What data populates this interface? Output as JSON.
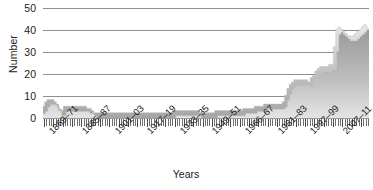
{
  "chart_data": {
    "type": "area",
    "title": "",
    "xlabel": "Years",
    "ylabel": "Number",
    "ylim": [
      0,
      50
    ],
    "yticks": [
      0,
      10,
      20,
      30,
      40,
      50
    ],
    "grid": true,
    "legend": "none",
    "x_tick_labels": [
      "1869–71",
      "1885–87",
      "1901–03",
      "1917–19",
      "1933–35",
      "1949–51",
      "1966–67",
      "1981–83",
      "1997–99",
      "2007–11"
    ],
    "categories": [
      "1866-67",
      "1867-68",
      "1868-69",
      "1869-71",
      "1870-72",
      "1871-73",
      "1872-74",
      "1873-75",
      "1875-77",
      "1876-78",
      "1877-79",
      "1878-80",
      "1879-81",
      "1880-82",
      "1881-83",
      "1882-84",
      "1884-86",
      "1885-87",
      "1886-88",
      "1887-89",
      "1888-90",
      "1889-91",
      "1890-92",
      "1891-93",
      "1893-95",
      "1894-96",
      "1895-97",
      "1896-98",
      "1897-99",
      "1898-00",
      "1899-01",
      "1900-02",
      "1901-03",
      "1902-04",
      "1903-05",
      "1904-06",
      "1905-07",
      "1906-08",
      "1907-09",
      "1908-10",
      "1909-11",
      "1910-12",
      "1911-13",
      "1912-14",
      "1913-15",
      "1914-16",
      "1915-17",
      "1916-18",
      "1917-19",
      "1918-20",
      "1919-21",
      "1920-22",
      "1921-23",
      "1922-24",
      "1923-25",
      "1924-26",
      "1925-27",
      "1926-28",
      "1927-29",
      "1928-30",
      "1929-31",
      "1930-32",
      "1931-33",
      "1932-34",
      "1933-35",
      "1934-36",
      "1935-37",
      "1936-38",
      "1937-39",
      "1938-40",
      "1939-41",
      "1940-42",
      "1941-43",
      "1942-44",
      "1943-45",
      "1944-46",
      "1945-47",
      "1946-48",
      "1947-49",
      "1948-50",
      "1949-51",
      "1950-52",
      "1951-53",
      "1952-54",
      "1953-55",
      "1954-56",
      "1955-57",
      "1956-58",
      "1957-59",
      "1958-60",
      "1959-61",
      "1960-62",
      "1961-63",
      "1962-64",
      "1963-65",
      "1964-66",
      "1966-67",
      "1967-69",
      "1968-70",
      "1969-71",
      "1970-72",
      "1971-73",
      "1972-74",
      "1973-75",
      "1974-76",
      "1975-77",
      "1976-78",
      "1977-79",
      "1978-80",
      "1979-81",
      "1980-82",
      "1981-83",
      "1982-84",
      "1983-85",
      "1984-86",
      "1985-87",
      "1986-88",
      "1987-89",
      "1988-90",
      "1989-91",
      "1990-92",
      "1991-93",
      "1992-94",
      "1993-95",
      "1994-96",
      "1995-97",
      "1996-98",
      "1997-99",
      "1998-00",
      "1999-01",
      "2000-02",
      "2001-03",
      "2002-04",
      "2003-05",
      "2004-06",
      "2005-07",
      "2006-08",
      "2007-09",
      "2008-10",
      "2007-11"
    ],
    "values": [
      2,
      3,
      5,
      6,
      6,
      6,
      5,
      4,
      1,
      1,
      3,
      3,
      3,
      3,
      3,
      3,
      3,
      3,
      3,
      3,
      2,
      2,
      1,
      0,
      0,
      0,
      0,
      0,
      0,
      0,
      0,
      0,
      0,
      0,
      0,
      0,
      0,
      0,
      0,
      0,
      0,
      0,
      0,
      0,
      0,
      0,
      0,
      0,
      0,
      0,
      0,
      0,
      0,
      0,
      0,
      0,
      0,
      1,
      1,
      1,
      1,
      1,
      1,
      1,
      1,
      1,
      1,
      1,
      0,
      0,
      0,
      0,
      0,
      0,
      0,
      1,
      1,
      1,
      1,
      1,
      1,
      1,
      1,
      1,
      1,
      1,
      1,
      2,
      2,
      2,
      2,
      2,
      3,
      3,
      3,
      3,
      4,
      4,
      4,
      4,
      4,
      4,
      4,
      4,
      5,
      8,
      11,
      13,
      14,
      15,
      15,
      15,
      15,
      15,
      15,
      14,
      16,
      17,
      19,
      20,
      21,
      21,
      21,
      21,
      22,
      22,
      30,
      38,
      39,
      38,
      37,
      36,
      35,
      35,
      35,
      36,
      37,
      38,
      39,
      40
    ]
  }
}
